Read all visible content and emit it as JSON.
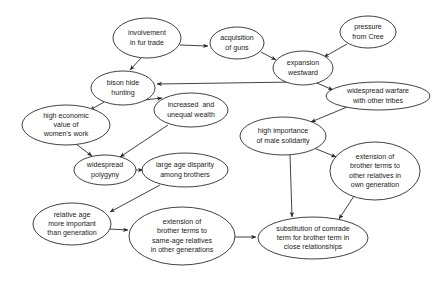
{
  "diagram": {
    "background_color": "#ffffff",
    "node_fill": "#ffffff",
    "node_stroke": "#2b2b2b",
    "text_color": "#1a1a1a",
    "nodes": [
      {
        "id": "fur-trade",
        "lines": [
          "involvement",
          "in fur trade"
        ],
        "cx": 147,
        "cy": 38,
        "rx": 34,
        "ry": 20
      },
      {
        "id": "guns",
        "lines": [
          "acquisition",
          "of guns"
        ],
        "cx": 237,
        "cy": 43,
        "rx": 27,
        "ry": 16
      },
      {
        "id": "expansion",
        "lines": [
          "expansion",
          "westward"
        ],
        "cx": 303,
        "cy": 68,
        "rx": 30,
        "ry": 17
      },
      {
        "id": "cree",
        "lines": [
          "pressure",
          "from Cree"
        ],
        "cx": 368,
        "cy": 32,
        "rx": 28,
        "ry": 16
      },
      {
        "id": "warfare",
        "lines": [
          "widespread warfare",
          "with other tribes"
        ],
        "cx": 378,
        "cy": 96,
        "rx": 52,
        "ry": 14
      },
      {
        "id": "bison",
        "lines": [
          "bison hide",
          "hunting"
        ],
        "cx": 123,
        "cy": 88,
        "rx": 32,
        "ry": 17
      },
      {
        "id": "wealth",
        "lines": [
          "increased  and",
          "unequal wealth"
        ],
        "cx": 191,
        "cy": 110,
        "rx": 37,
        "ry": 17
      },
      {
        "id": "womens-work",
        "lines": [
          "high economic",
          "value of",
          "women's work"
        ],
        "cx": 66,
        "cy": 125,
        "rx": 44,
        "ry": 20
      },
      {
        "id": "polygyny",
        "lines": [
          "widespread",
          "polygyny"
        ],
        "cx": 105,
        "cy": 170,
        "rx": 31,
        "ry": 15
      },
      {
        "id": "age-disparity",
        "lines": [
          "large age disparity",
          "among brothers"
        ],
        "cx": 185,
        "cy": 170,
        "rx": 43,
        "ry": 17
      },
      {
        "id": "male-solidarity",
        "lines": [
          "high importance",
          "of male solidarity"
        ],
        "cx": 283,
        "cy": 136,
        "rx": 43,
        "ry": 19
      },
      {
        "id": "own-generation",
        "lines": [
          "extension of",
          "brother terms to",
          "other relatives in",
          "own generation"
        ],
        "cx": 375,
        "cy": 171,
        "rx": 45,
        "ry": 29
      },
      {
        "id": "relative-age",
        "lines": [
          "relative age",
          "more important",
          "than generation"
        ],
        "cx": 72,
        "cy": 224,
        "rx": 39,
        "ry": 21
      },
      {
        "id": "other-generations",
        "lines": [
          "extension of",
          "brother terms to",
          "same-age relatives",
          "in other generations"
        ],
        "cx": 182,
        "cy": 236,
        "rx": 53,
        "ry": 29
      },
      {
        "id": "comrade-term",
        "lines": [
          "substitution of comrade",
          "term for brother term in",
          "close relationships"
        ],
        "cx": 313,
        "cy": 238,
        "rx": 55,
        "ry": 21
      }
    ],
    "edges": [
      {
        "id": "fur-trade-to-guns",
        "from": "fur-trade",
        "to": "guns",
        "x1": 180,
        "y1": 45,
        "x2": 208,
        "y2": 46
      },
      {
        "id": "fur-trade-to-bison",
        "from": "fur-trade",
        "to": "bison",
        "x1": 141,
        "y1": 58,
        "x2": 130,
        "y2": 70
      },
      {
        "id": "guns-to-expansion",
        "from": "guns",
        "to": "expansion",
        "x1": 261,
        "y1": 52,
        "x2": 276,
        "y2": 60
      },
      {
        "id": "cree-to-expansion",
        "from": "cree",
        "to": "expansion",
        "x1": 347,
        "y1": 44,
        "x2": 324,
        "y2": 57
      },
      {
        "id": "expansion-to-bison",
        "from": "expansion",
        "to": "bison",
        "x1": 296,
        "y1": 82,
        "x2": 157,
        "y2": 84
      },
      {
        "id": "expansion-to-warfare",
        "from": "expansion",
        "to": "warfare",
        "x1": 317,
        "y1": 83,
        "x2": 333,
        "y2": 90
      },
      {
        "id": "bison-to-womens-work",
        "from": "bison",
        "to": "womens-work",
        "x1": 104,
        "y1": 102,
        "x2": 90,
        "y2": 110
      },
      {
        "id": "bison-to-wealth",
        "from": "bison",
        "to": "wealth",
        "x1": 144,
        "y1": 100,
        "x2": 162,
        "y2": 98
      },
      {
        "id": "warfare-to-solidarity",
        "from": "warfare",
        "to": "solidarity",
        "x1": 347,
        "y1": 107,
        "x2": 311,
        "y2": 122
      },
      {
        "id": "womens-work-to-polygyny",
        "from": "womens-work",
        "to": "polygyny",
        "x1": 76,
        "y1": 144,
        "x2": 92,
        "y2": 156
      },
      {
        "id": "wealth-to-polygyny",
        "from": "wealth",
        "to": "polygyny",
        "x1": 168,
        "y1": 125,
        "x2": 120,
        "y2": 157
      },
      {
        "id": "polygyny-to-disparity",
        "from": "polygyny",
        "to": "age-disparity",
        "x1": 136,
        "y1": 170,
        "x2": 143,
        "y2": 170
      },
      {
        "id": "solidarity-to-own-generation",
        "from": "male-solidarity",
        "to": "own-generation",
        "x1": 314,
        "y1": 148,
        "x2": 336,
        "y2": 157
      },
      {
        "id": "solidarity-to-comrade",
        "from": "male-solidarity",
        "to": "comrade-term",
        "x1": 290,
        "y1": 155,
        "x2": 292,
        "y2": 217
      },
      {
        "id": "own-generation-to-comrade",
        "from": "own-generation",
        "to": "comrade-term",
        "x1": 354,
        "y1": 196,
        "x2": 339,
        "y2": 219
      },
      {
        "id": "disparity-to-relative-age",
        "from": "age-disparity",
        "to": "relative-age",
        "x1": 160,
        "y1": 185,
        "x2": 110,
        "y2": 212
      },
      {
        "id": "relative-age-to-other-generations",
        "from": "relative-age",
        "to": "other-generations",
        "x1": 109,
        "y1": 229,
        "x2": 128,
        "y2": 230
      },
      {
        "id": "other-generations-to-comrade",
        "from": "other-generations",
        "to": "comrade-term",
        "x1": 234,
        "y1": 237,
        "x2": 256,
        "y2": 237
      }
    ]
  }
}
